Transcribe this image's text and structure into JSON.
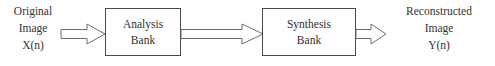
{
  "diagram": {
    "stroke_color": "#6d6d6d",
    "box_border_color": "#4a4a4a",
    "text_color": "#333333",
    "background_color": "#ffffff",
    "input_label": {
      "line1": "Original",
      "line2": "Image",
      "line3": "X(n)"
    },
    "analysis_bank": {
      "line1": "Analysis",
      "line2": "Bank"
    },
    "synthesis_bank": {
      "line1": "Synthesis",
      "line2": "Bank"
    },
    "output_label": {
      "line1": "Reconstructed",
      "line2": "Image",
      "line3": "Y(n)"
    },
    "arrows": {
      "input_to_analysis": "block-arrow-right",
      "analysis_to_synthesis": "block-arrow-right",
      "synthesis_to_output": "block-arrow-right"
    }
  }
}
